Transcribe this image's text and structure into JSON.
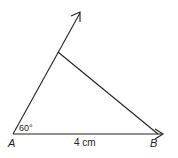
{
  "diagram": {
    "type": "geometry-construction",
    "points": {
      "A": {
        "label": "A"
      },
      "B": {
        "label": "B"
      }
    },
    "angle_label": "60°",
    "side_label": "4 cm",
    "stroke_color": "#222222",
    "background": "#ffffff"
  }
}
